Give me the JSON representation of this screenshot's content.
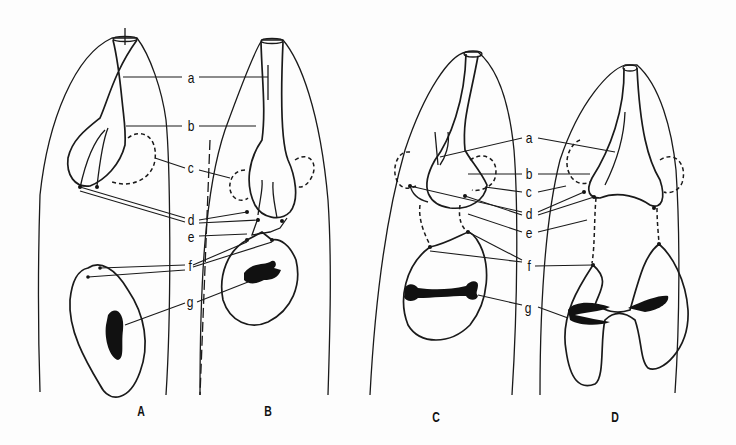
{
  "figure": {
    "type": "scientific line drawing",
    "panels": [
      {
        "id": "A",
        "label": "A"
      },
      {
        "id": "B",
        "label": "B"
      },
      {
        "id": "C",
        "label": "C"
      },
      {
        "id": "D",
        "label": "D"
      }
    ],
    "left_pair_labels": {
      "a": "a",
      "b": "b",
      "c": "c",
      "d": "d",
      "e": "e",
      "f": "f",
      "g": "g"
    },
    "right_pair_labels": {
      "a": "a",
      "b": "b",
      "c": "c",
      "d": "d",
      "e": "e",
      "f": "f",
      "g": "g"
    }
  }
}
